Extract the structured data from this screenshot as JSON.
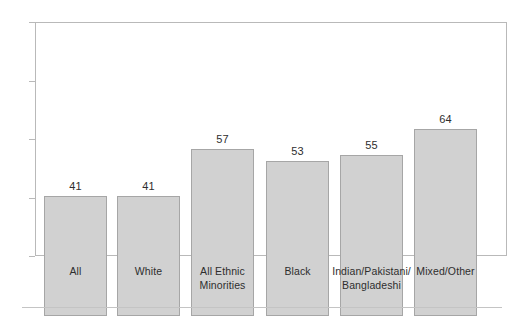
{
  "chart_data": {
    "type": "bar",
    "title": "",
    "xlabel": "",
    "ylabel": "",
    "categories": [
      "All",
      "White",
      "All Ethnic Minorities",
      "Black",
      "Indian/Pakistani/ Bangladeshi",
      "Mixed/Other"
    ],
    "category_lines": [
      [
        "All",
        ""
      ],
      [
        "White",
        ""
      ],
      [
        "All Ethnic",
        "Minorities"
      ],
      [
        "Black",
        ""
      ],
      [
        "Indian/Pakistani/",
        "Bangladeshi"
      ],
      [
        "Mixed/Other",
        ""
      ]
    ],
    "values": [
      41,
      41,
      57,
      53,
      55,
      64
    ],
    "value_labels": [
      "41",
      "41",
      "57",
      "53",
      "55",
      "64"
    ],
    "ylim": [
      0,
      80
    ],
    "yticks": [
      0,
      20,
      40,
      60,
      80
    ],
    "ytick_labels": [
      "0",
      "20",
      "40",
      "60",
      "80"
    ],
    "grid": false,
    "legend": null,
    "colors": {
      "bar_fill": "#d1d1d1",
      "bar_border": "#a6a6a6",
      "frame": "#b9b9b9",
      "text": "#2e2e2e",
      "rule": "#c4c4c4"
    }
  }
}
